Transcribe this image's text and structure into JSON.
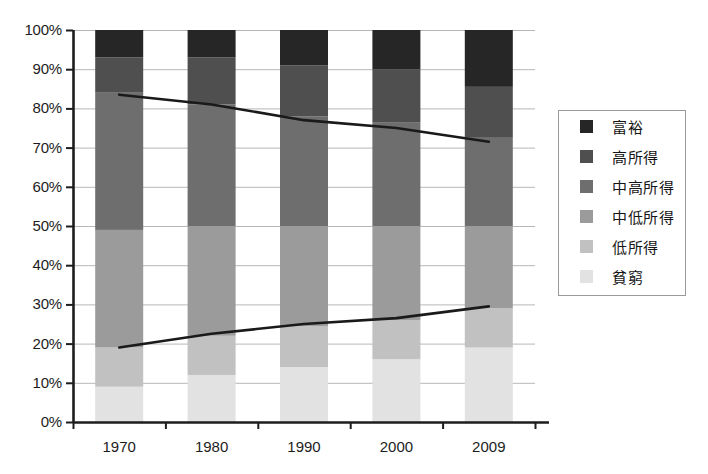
{
  "chart_data": {
    "type": "bar",
    "subtype": "stacked-bar-100-percent-with-overlay-lines",
    "title": "",
    "xlabel": "",
    "ylabel": "",
    "categories": [
      "1970",
      "1980",
      "1990",
      "2000",
      "2009"
    ],
    "ylim": [
      0,
      100
    ],
    "y_tick_labels": [
      "0%",
      "10%",
      "20%",
      "30%",
      "40%",
      "50%",
      "60%",
      "70%",
      "80%",
      "90%",
      "100%"
    ],
    "y_tick_values": [
      0,
      10,
      20,
      30,
      40,
      50,
      60,
      70,
      80,
      90,
      100
    ],
    "grid": true,
    "grid_axis": "y",
    "legend_position": "right",
    "stack_order_bottom_to_top": [
      "貧窮",
      "低所得",
      "中低所得",
      "中高所得",
      "高所得",
      "富裕"
    ],
    "series": [
      {
        "name": "富裕",
        "color": "#262626",
        "values": [
          7.0,
          7.0,
          9.0,
          10.0,
          14.5
        ]
      },
      {
        "name": "高所得",
        "color": "#4f4f4f",
        "values": [
          9.0,
          12.0,
          13.0,
          13.5,
          13.0
        ]
      },
      {
        "name": "中高所得",
        "color": "#6e6e6e",
        "values": [
          35.0,
          31.0,
          28.0,
          26.5,
          22.5
        ]
      },
      {
        "name": "中低所得",
        "color": "#9b9b9b",
        "values": [
          30.0,
          28.0,
          25.5,
          24.0,
          21.0
        ]
      },
      {
        "name": "低所得",
        "color": "#c1c1c1",
        "values": [
          10.0,
          10.0,
          10.5,
          10.0,
          10.0
        ]
      },
      {
        "name": "貧窮",
        "color": "#e2e2e2",
        "values": [
          9.0,
          12.0,
          14.0,
          16.0,
          19.0
        ]
      }
    ],
    "cumulative_tops": {
      "貧窮": [
        9.0,
        12.0,
        14.0,
        16.0,
        19.0
      ],
      "低所得": [
        19.0,
        22.0,
        24.5,
        26.0,
        29.0
      ],
      "中低所得": [
        49.0,
        50.0,
        50.0,
        50.0,
        50.0
      ],
      "中高所得": [
        84.0,
        81.0,
        78.0,
        76.5,
        72.5
      ],
      "高所得": [
        93.0,
        93.0,
        91.0,
        90.0,
        85.5
      ],
      "富裕": [
        100.0,
        100.0,
        100.0,
        100.0,
        100.0
      ]
    },
    "overlay_lines": [
      {
        "name": "upper-trend-line",
        "color": "#1a1a1a",
        "values": [
          83.5,
          81.0,
          77.0,
          75.0,
          71.5
        ]
      },
      {
        "name": "lower-trend-line",
        "color": "#1a1a1a",
        "values": [
          19.0,
          22.5,
          25.0,
          26.5,
          29.5
        ]
      }
    ]
  },
  "legend": {
    "items": [
      {
        "label": "富裕",
        "color": "#262626"
      },
      {
        "label": "高所得",
        "color": "#4f4f4f"
      },
      {
        "label": "中高所得",
        "color": "#6e6e6e"
      },
      {
        "label": "中低所得",
        "color": "#9b9b9b"
      },
      {
        "label": "低所得",
        "color": "#c1c1c1"
      },
      {
        "label": "貧窮",
        "color": "#e2e2e2"
      }
    ]
  },
  "colors": {
    "axis": "#1d1d1d",
    "gridline": "#b7b7b7",
    "plot_background": "#ffffff",
    "legend_border": "#9a9a9a",
    "trend_line": "#1a1a1a"
  },
  "geometry": {
    "plot_left": 73,
    "plot_right": 535,
    "plot_top": 30,
    "plot_bottom": 422,
    "bar_width": 48,
    "legend_left": 558,
    "legend_top": 110,
    "legend_width": 128,
    "legend_height": 186
  }
}
